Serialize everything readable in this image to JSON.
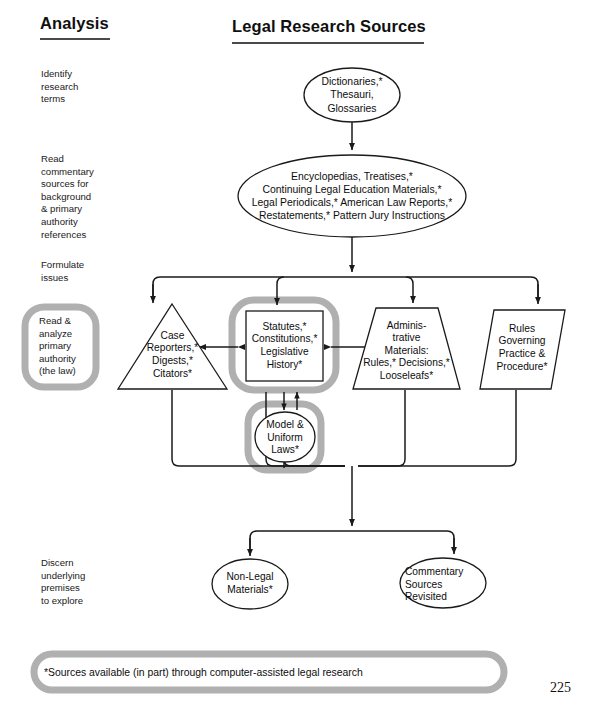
{
  "page": {
    "number": "225"
  },
  "headers": {
    "left": "Analysis",
    "right": "Legal Research Sources"
  },
  "stages": [
    {
      "id": "identify",
      "label": "Identify\nresearch\nterms"
    },
    {
      "id": "read-commentary",
      "label": "Read\ncommentary\nsources for\nbackground\n& primary\nauthority\nreferences"
    },
    {
      "id": "formulate",
      "label": "Formulate\nissues"
    },
    {
      "id": "read-analyze",
      "label": "Read &\nanalyze\nprimary\nauthority\n(the law)"
    },
    {
      "id": "discern",
      "label": "Discern\nunderlying\npremises\nto explore"
    }
  ],
  "nodes": {
    "dictionaries": "Dictionaries,*\nThesauri,\nGlossaries",
    "encyclopedias": "Encyclopedias, Treatises,*\nContinuing Legal Education Materials,*\nLegal Periodicals,* American Law Reports,*\nRestatements,* Pattern Jury Instructions",
    "case_reporters": "Case\nReporters,*\nDigests,*\nCitators*",
    "statutes": "Statutes,*\nConstitutions,*\nLegislative\nHistory*",
    "administrative": "Adminis-\ntrative\nMaterials:\nRules,* Decisions,*\nLooseleafs*",
    "rules_governing": "Rules\nGoverning\nPractice &\nProcedure*",
    "model_uniform": "Model &\nUniform\nLaws*",
    "non_legal": "Non-Legal\nMaterials*",
    "commentary_revisited": "Commentary\nSources\nRevisited"
  },
  "footnote": "*Sources available (in part) through computer-assisted legal research",
  "colors": {
    "stroke": "#1a1a1a",
    "highlight": "#b0b0b0",
    "text": "#0d0d0d",
    "rule": "#4a4a4a",
    "background": "#ffffff"
  }
}
